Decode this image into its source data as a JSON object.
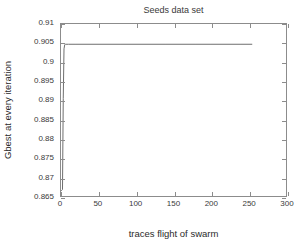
{
  "chart_data": {
    "type": "line",
    "title": "Seeds data set",
    "xlabel": "traces flight of swarm",
    "ylabel": "Gbest at every iteration",
    "xlim": [
      0,
      300
    ],
    "ylim": [
      0.865,
      0.91
    ],
    "xticks": [
      0,
      50,
      100,
      150,
      200,
      250,
      300
    ],
    "xtick_labels": [
      "0",
      "50",
      "100",
      "150",
      "200",
      "250",
      "300"
    ],
    "yticks": [
      0.865,
      0.87,
      0.875,
      0.88,
      0.885,
      0.89,
      0.895,
      0.9,
      0.905,
      0.91
    ],
    "ytick_labels": [
      "0.865",
      "0.87",
      "0.875",
      "0.88",
      "0.885",
      "0.89",
      "0.895",
      "0.9",
      "0.905",
      "0.91"
    ],
    "grid": false,
    "legend": null,
    "series": [
      {
        "name": "Gbest",
        "color": "#6e6e6e",
        "line_width": 1,
        "x": [
          0,
          1,
          2,
          3,
          4,
          5,
          6,
          8,
          10,
          20,
          40,
          60,
          80,
          100,
          120,
          140,
          160,
          180,
          200,
          220,
          240,
          255
        ],
        "y": [
          0.8663,
          0.8665,
          0.8667,
          0.8905,
          0.9035,
          0.9046,
          0.9047,
          0.9047,
          0.9047,
          0.9047,
          0.9047,
          0.9047,
          0.9047,
          0.9047,
          0.9047,
          0.9047,
          0.9047,
          0.9047,
          0.9047,
          0.9047,
          0.9047,
          0.9047
        ]
      }
    ],
    "axis_color": "#8c8c8c",
    "text_color": "#2b2b2b"
  }
}
